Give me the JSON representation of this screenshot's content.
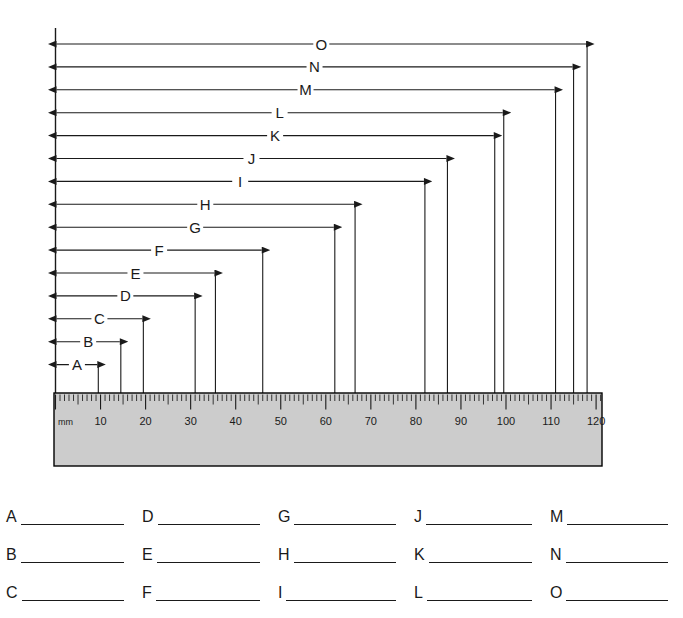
{
  "worksheet": {
    "title": "Metric ruler measurement worksheet",
    "axis_origin_label": "mm"
  },
  "ruler": {
    "unit_label": "mm",
    "min": 0,
    "max": 122,
    "major_tick_interval": 10,
    "minor_tick_interval": 1,
    "numbers": [
      "10",
      "20",
      "30",
      "40",
      "50",
      "60",
      "70",
      "80",
      "90",
      "100",
      "110",
      "120"
    ],
    "body_color": "#cccccc",
    "border_color": "#000000"
  },
  "measurements": [
    {
      "label": "A",
      "value_mm": 9.5
    },
    {
      "label": "B",
      "value_mm": 14.5
    },
    {
      "label": "C",
      "value_mm": 19.5
    },
    {
      "label": "D",
      "value_mm": 31
    },
    {
      "label": "E",
      "value_mm": 35.5
    },
    {
      "label": "F",
      "value_mm": 46
    },
    {
      "label": "G",
      "value_mm": 62
    },
    {
      "label": "H",
      "value_mm": 66.5
    },
    {
      "label": "I",
      "value_mm": 82
    },
    {
      "label": "J",
      "value_mm": 87
    },
    {
      "label": "K",
      "value_mm": 97.5
    },
    {
      "label": "L",
      "value_mm": 99.5
    },
    {
      "label": "M",
      "value_mm": 111
    },
    {
      "label": "N",
      "value_mm": 115
    },
    {
      "label": "O",
      "value_mm": 118
    }
  ],
  "answers": {
    "rows": [
      [
        {
          "label": "A",
          "value": ""
        },
        {
          "label": "D",
          "value": ""
        },
        {
          "label": "G",
          "value": ""
        },
        {
          "label": "J",
          "value": ""
        },
        {
          "label": "M",
          "value": ""
        }
      ],
      [
        {
          "label": "B",
          "value": ""
        },
        {
          "label": "E",
          "value": ""
        },
        {
          "label": "H",
          "value": ""
        },
        {
          "label": "K",
          "value": ""
        },
        {
          "label": "N",
          "value": ""
        }
      ],
      [
        {
          "label": "C",
          "value": ""
        },
        {
          "label": "F",
          "value": ""
        },
        {
          "label": "I",
          "value": ""
        },
        {
          "label": "L",
          "value": ""
        },
        {
          "label": "O",
          "value": ""
        }
      ]
    ]
  },
  "chart_data": {
    "type": "bar",
    "xlabel": "mm",
    "ylabel": "",
    "categories": [
      "A",
      "B",
      "C",
      "D",
      "E",
      "F",
      "G",
      "H",
      "I",
      "J",
      "K",
      "L",
      "M",
      "N",
      "O"
    ],
    "values": [
      9.5,
      14.5,
      19.5,
      31,
      35.5,
      46,
      62,
      66.5,
      82,
      87,
      97.5,
      99.5,
      111,
      115,
      118
    ],
    "xlim": [
      0,
      122
    ],
    "grid": false,
    "legend": "none",
    "tick_labels": [
      "mm",
      "10",
      "20",
      "30",
      "40",
      "50",
      "60",
      "70",
      "80",
      "90",
      "100",
      "110",
      "120"
    ]
  }
}
